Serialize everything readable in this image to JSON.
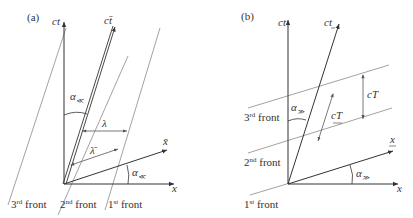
{
  "panels": [
    {
      "id": "a",
      "label": "(a)",
      "axes": {
        "time": "ct",
        "space": "x",
        "moving_time": "ct̄",
        "moving_space": "x̄"
      },
      "angle_label": "α",
      "angle_subscript": "≪",
      "wavelength": "λ",
      "wavelength_moving": "λ̄",
      "fronts": [
        {
          "ord": "3",
          "suffix": "rd",
          "word": "front"
        },
        {
          "ord": "2",
          "suffix": "nd",
          "word": "front"
        },
        {
          "ord": "1",
          "suffix": "st",
          "word": "front"
        }
      ]
    },
    {
      "id": "b",
      "label": "(b)",
      "axes": {
        "time": "ct",
        "space": "x",
        "moving_time": "ct",
        "moving_space": "x"
      },
      "angle_label": "α",
      "angle_subscript": "≫",
      "period": "cT",
      "period_moving": "cT",
      "fronts": [
        {
          "ord": "3",
          "suffix": "rd",
          "word": "front"
        },
        {
          "ord": "2",
          "suffix": "nd",
          "word": "front"
        },
        {
          "ord": "1",
          "suffix": "st",
          "word": "front"
        }
      ]
    }
  ],
  "colors": {
    "line": "#333333",
    "front": "#8a8a8a",
    "bg": "#ffffff"
  }
}
